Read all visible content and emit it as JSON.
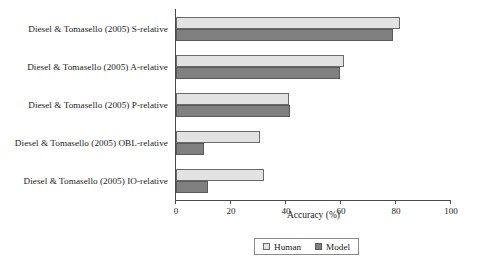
{
  "chart_data": {
    "type": "bar",
    "orientation": "horizontal",
    "title": "",
    "xlabel": "Accuracy (%)",
    "ylabel": "",
    "xlim": [
      0,
      100
    ],
    "xticks": [
      0,
      20,
      40,
      60,
      80,
      100
    ],
    "grid": false,
    "legend_position": "bottom",
    "categories": [
      "Diesel & Tomasello (2005) S-relative",
      "Diesel & Tomasello (2005) A-relative",
      "Diesel & Tomasello (2005) P-relative",
      "Diesel & Tomasello (2005) OBL-relative",
      "Diesel & Tomasello (2005) IO-relative"
    ],
    "series": [
      {
        "name": "Human",
        "color": "#e2e2e2",
        "values": [
          81.5,
          61,
          41,
          30.5,
          32
        ]
      },
      {
        "name": "Model",
        "color": "#808080",
        "values": [
          79,
          59.5,
          41.5,
          10,
          11.5
        ]
      }
    ]
  },
  "legend": {
    "items": [
      {
        "label": "Human",
        "swatch": "human"
      },
      {
        "label": "Model",
        "swatch": "model"
      }
    ]
  }
}
